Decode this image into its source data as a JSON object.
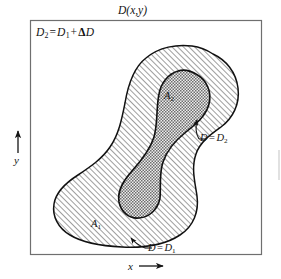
{
  "figure": {
    "title": "D(x,y)",
    "caption_symbols": {
      "equation": {
        "lhs": "D",
        "lhs_sub": "2",
        "eq": "=",
        "rhs1": "D",
        "rhs1_sub": "1",
        "plus": "+",
        "delta": "Δ",
        "rhs2": "D"
      },
      "equation_text": "D2 = D1 + ΔD"
    },
    "axes": {
      "x_label": "x",
      "x_arrow": "right-arrow",
      "y_label": "y",
      "y_arrow": "up-arrow"
    },
    "regions": [
      {
        "id": "outer",
        "label": "A",
        "label_sub": "1",
        "label_text": "A1",
        "boundary_label": "D",
        "boundary_label_sub": "1",
        "boundary_text": "D = D1",
        "fill_pattern": "diagonal-hatch",
        "fill_color": "#7d7d7d",
        "background": "#ffffff"
      },
      {
        "id": "inner",
        "label": "A",
        "label_sub": "2",
        "label_text": "A2",
        "boundary_label": "D",
        "boundary_label_sub": "2",
        "boundary_text": "D = D2",
        "fill_pattern": "cross-hatch",
        "fill_color": "#5a5a5a",
        "background": "#d8d8d8"
      }
    ],
    "annotations": [
      {
        "name": "d2-callout",
        "text_d": "D",
        "text_eq": "=",
        "text_val": "D",
        "sub": "2",
        "full": "D = D2",
        "leader": "elbow-with-arrow"
      },
      {
        "name": "d1-callout",
        "text_d": "D",
        "text_eq": "=",
        "text_val": "D",
        "sub": "1",
        "full": "D = D1",
        "leader": "elbow-with-arrow"
      }
    ],
    "frame": {
      "stroke": "#6f6f6f",
      "fill": "#ffffff"
    },
    "stroke_color": "#111111"
  }
}
